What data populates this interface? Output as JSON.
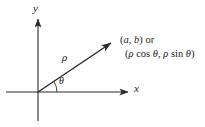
{
  "figure": {
    "background_color": "#ffffff",
    "stroke_color": "#2b2b2b",
    "axes": {
      "y_axis_label": "y",
      "x_axis_label": "x",
      "origin": {
        "x": 38,
        "y": 92
      },
      "x_axis_start": {
        "x": 6,
        "y": 92
      },
      "x_axis_end": {
        "x": 130,
        "y": 92
      },
      "y_axis_top": {
        "x": 38,
        "y": 17
      },
      "y_axis_bottom": {
        "x": 38,
        "y": 121
      }
    },
    "ray": {
      "label": "ρ",
      "from": {
        "x": 38,
        "y": 92
      },
      "to": {
        "x": 114,
        "y": 41
      },
      "angle_degrees": 33.9
    },
    "angle": {
      "label": "θ",
      "arc_radius": 19,
      "from_degrees": 0,
      "to_degrees": 33.9
    },
    "point_label": {
      "line1_open": "(",
      "line1_a": "a",
      "line1_comma": ", ",
      "line1_b": "b",
      "line1_close": ")",
      "line1_or": "or",
      "line2_open": "(",
      "line2_rho1": "ρ",
      "line2_cos": "cos",
      "line2_theta1": "θ",
      "line2_comma": ", ",
      "line2_rho2": "ρ",
      "line2_sin": "sin",
      "line2_theta2": "θ",
      "line2_close": ")",
      "line1_full": "(a, b) or",
      "line2_full": "(ρ cos θ, ρ sin θ)"
    }
  }
}
